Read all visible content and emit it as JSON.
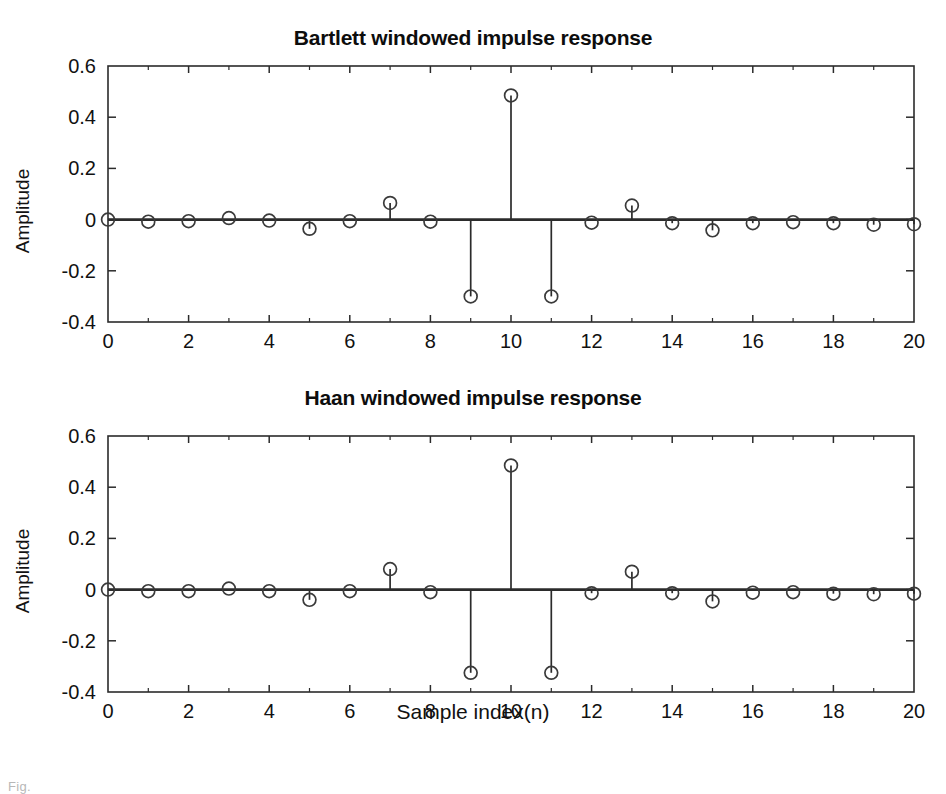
{
  "figure": {
    "caption": "Fig.",
    "background": "#ffffff",
    "line_color": "#2b2b2b",
    "marker_color": "#3a3a3a"
  },
  "chart_data": [
    {
      "type": "stem",
      "id": "bartlett",
      "title": "Bartlett windowed impulse response",
      "xlabel": "",
      "ylabel": "Amplitude",
      "xlim": [
        0,
        20
      ],
      "ylim": [
        -0.4,
        0.6
      ],
      "xticks": [
        0,
        2,
        4,
        6,
        8,
        10,
        12,
        14,
        16,
        18,
        20
      ],
      "xticklabels": [
        "0",
        "2",
        "4",
        "6",
        "8",
        "10",
        "12",
        "14",
        "16",
        "18",
        "20"
      ],
      "yticks": [
        -0.4,
        -0.2,
        0,
        0.2,
        0.4,
        0.6
      ],
      "yticklabels": [
        "-0.4",
        "-0.2",
        "0",
        "0.2",
        "0.4",
        "0.6"
      ],
      "grid": false,
      "minor_xticks": [
        1,
        3,
        5,
        7,
        9,
        11,
        13,
        15,
        17,
        19
      ],
      "x": [
        0,
        1,
        2,
        3,
        4,
        5,
        6,
        7,
        8,
        9,
        10,
        11,
        12,
        13,
        14,
        15,
        16,
        17,
        18,
        19,
        20
      ],
      "values": [
        0.0,
        -0.008,
        -0.006,
        0.006,
        -0.004,
        -0.036,
        -0.006,
        0.065,
        -0.008,
        -0.3,
        0.485,
        -0.3,
        -0.012,
        0.055,
        -0.014,
        -0.042,
        -0.014,
        -0.01,
        -0.014,
        -0.02,
        -0.018
      ]
    },
    {
      "type": "stem",
      "id": "haan",
      "title": "Haan windowed impulse response",
      "xlabel": "Sample index(n)",
      "ylabel": "Amplitude",
      "xlim": [
        0,
        20
      ],
      "ylim": [
        -0.4,
        0.6
      ],
      "xticks": [
        0,
        2,
        4,
        6,
        8,
        10,
        12,
        14,
        16,
        18,
        20
      ],
      "xticklabels": [
        "0",
        "2",
        "4",
        "6",
        "8",
        "10",
        "12",
        "14",
        "16",
        "18",
        "20"
      ],
      "yticks": [
        -0.4,
        -0.2,
        0,
        0.2,
        0.4,
        0.6
      ],
      "yticklabels": [
        "-0.4",
        "-0.2",
        "0",
        "0.2",
        "0.4",
        "0.6"
      ],
      "grid": false,
      "minor_xticks": [
        1,
        3,
        5,
        7,
        9,
        11,
        13,
        15,
        17,
        19
      ],
      "x": [
        0,
        1,
        2,
        3,
        4,
        5,
        6,
        7,
        8,
        9,
        10,
        11,
        12,
        13,
        14,
        15,
        16,
        17,
        18,
        19,
        20
      ],
      "values": [
        0.0,
        -0.006,
        -0.006,
        0.004,
        -0.006,
        -0.04,
        -0.006,
        0.08,
        -0.01,
        -0.325,
        0.485,
        -0.325,
        -0.014,
        0.07,
        -0.014,
        -0.046,
        -0.012,
        -0.01,
        -0.016,
        -0.018,
        -0.016
      ]
    }
  ]
}
